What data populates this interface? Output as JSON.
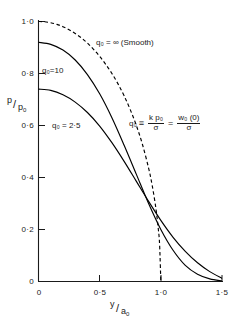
{
  "chart_data": {
    "type": "line",
    "title": "",
    "xlabel": "y/a0",
    "ylabel": "p/p0",
    "xlim": [
      0,
      1.5
    ],
    "ylim": [
      0,
      1.0
    ],
    "grid": false,
    "legend": "inline-curve-labels",
    "x_ticks": [
      {
        "value": 0,
        "label": "0"
      },
      {
        "value": 0.5,
        "label": "0·5"
      },
      {
        "value": 1.0,
        "label": "1·0"
      },
      {
        "value": 1.5,
        "label": "1·5"
      }
    ],
    "y_ticks": [
      {
        "value": 0,
        "label": "0"
      },
      {
        "value": 0.2,
        "label": "0·2"
      },
      {
        "value": 0.4,
        "label": "0·4"
      },
      {
        "value": 0.6,
        "label": "0·6"
      },
      {
        "value": 0.8,
        "label": "0·8"
      },
      {
        "value": 1.0,
        "label": "1·0"
      }
    ],
    "series": [
      {
        "name": "q0 = infinity (Smooth)",
        "style": "dashed",
        "x": [
          0.0,
          0.05,
          0.1,
          0.15,
          0.2,
          0.25,
          0.3,
          0.35,
          0.4,
          0.45,
          0.5,
          0.55,
          0.6,
          0.65,
          0.7,
          0.75,
          0.8,
          0.85,
          0.9,
          0.93,
          0.96,
          0.98,
          0.99,
          1.0
        ],
        "values": [
          1.0,
          0.999,
          0.995,
          0.989,
          0.98,
          0.968,
          0.954,
          0.937,
          0.917,
          0.893,
          0.866,
          0.835,
          0.8,
          0.76,
          0.714,
          0.661,
          0.6,
          0.527,
          0.436,
          0.368,
          0.28,
          0.199,
          0.141,
          0.0
        ]
      },
      {
        "name": "q0 = 10",
        "style": "solid",
        "x": [
          0.0,
          0.1,
          0.2,
          0.3,
          0.4,
          0.5,
          0.6,
          0.7,
          0.8,
          0.9,
          1.0,
          1.1,
          1.2,
          1.3,
          1.4,
          1.5
        ],
        "values": [
          0.92,
          0.912,
          0.89,
          0.852,
          0.796,
          0.722,
          0.63,
          0.524,
          0.412,
          0.3,
          0.2,
          0.12,
          0.062,
          0.028,
          0.01,
          0.002
        ]
      },
      {
        "name": "q0 = 2·5",
        "style": "solid",
        "x": [
          0.0,
          0.1,
          0.2,
          0.3,
          0.4,
          0.5,
          0.6,
          0.7,
          0.8,
          0.9,
          1.0,
          1.1,
          1.2,
          1.3,
          1.4,
          1.5
        ],
        "values": [
          0.74,
          0.735,
          0.718,
          0.69,
          0.65,
          0.598,
          0.534,
          0.462,
          0.385,
          0.308,
          0.235,
          0.17,
          0.116,
          0.072,
          0.038,
          0.012
        ]
      }
    ],
    "annotations": {
      "curve_label_infinity": {
        "text": "q₀ = ∞ (Smooth)",
        "x": 0.66,
        "y": 0.885
      },
      "curve_label_10": {
        "text": "q₀=10",
        "x": 0.1,
        "y": 0.77
      },
      "curve_label_2_5": {
        "text": "q₀ = 2·5",
        "x": 0.18,
        "y": 0.575
      },
      "identity": {
        "symbol": "q₀",
        "identical_to": "≡",
        "term1_numerator": "k p₀",
        "term1_denominator": "σ",
        "equals": "=",
        "term2_numerator": "w₀ (0)",
        "term2_denominator": "σ"
      }
    },
    "axis_label_parts": {
      "y_numerator": "p",
      "y_denominator": "p₀",
      "x_numerator": "y",
      "x_denominator": "a₀"
    },
    "colors": {
      "axis": "#1a1a1a",
      "curve": "#000000",
      "background": "#ffffff"
    }
  }
}
